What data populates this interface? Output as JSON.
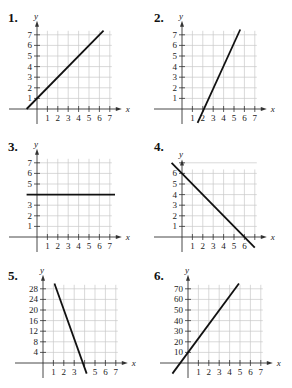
{
  "problems": [
    {
      "label": "1.",
      "xlabel": "x",
      "ylabel": "y"
    },
    {
      "label": "2.",
      "xlabel": "x",
      "ylabel": "y"
    },
    {
      "label": "3.",
      "xlabel": "x",
      "ylabel": "y"
    },
    {
      "label": "4.",
      "xlabel": "x",
      "ylabel": "y"
    },
    {
      "label": "5.",
      "xlabel": "x",
      "ylabel": "y"
    },
    {
      "label": "6.",
      "xlabel": "x",
      "ylabel": "y"
    }
  ],
  "chart_data": [
    {
      "type": "line",
      "title": "1.",
      "xlabel": "x",
      "ylabel": "y",
      "x_ticks": [
        1,
        2,
        3,
        4,
        5,
        6,
        7
      ],
      "y_ticks": [
        1,
        2,
        3,
        4,
        5,
        6,
        7
      ],
      "xlim": [
        -1,
        7.5
      ],
      "ylim": [
        -1,
        7.8
      ],
      "grid": true,
      "series": [
        {
          "name": "line",
          "x": [
            -1,
            6.4
          ],
          "y": [
            0,
            7.4
          ]
        }
      ],
      "equation_hint": "y = x + 1"
    },
    {
      "type": "line",
      "title": "2.",
      "xlabel": "x",
      "ylabel": "y",
      "x_ticks": [
        1,
        2,
        3,
        4,
        5,
        6,
        7
      ],
      "y_ticks": [
        1,
        2,
        3,
        4,
        5,
        6,
        7
      ],
      "xlim": [
        -0.5,
        7.5
      ],
      "ylim": [
        -1,
        7.8
      ],
      "grid": true,
      "series": [
        {
          "name": "line",
          "x": [
            1.5,
            5.6
          ],
          "y": [
            -1.3,
            7.5
          ]
        }
      ],
      "equation_hint": "y = 2x - 4"
    },
    {
      "type": "line",
      "title": "3.",
      "xlabel": "x",
      "ylabel": "y",
      "x_ticks": [
        1,
        2,
        3,
        4,
        5,
        6,
        7
      ],
      "y_ticks": [
        1,
        2,
        3,
        5,
        6,
        7
      ],
      "xlim": [
        -1,
        7.5
      ],
      "ylim": [
        -1,
        7.8
      ],
      "grid": true,
      "series": [
        {
          "name": "line",
          "x": [
            -1,
            7.5
          ],
          "y": [
            4,
            4
          ]
        }
      ],
      "equation_hint": "y = 4"
    },
    {
      "type": "line",
      "title": "4.",
      "xlabel": "x",
      "ylabel": "y",
      "x_ticks": [
        1,
        2,
        3,
        4,
        5,
        6
      ],
      "y_ticks": [
        1,
        2,
        3,
        4,
        5,
        6
      ],
      "xlim": [
        -1,
        7.5
      ],
      "ylim": [
        -1,
        7.8
      ],
      "grid": true,
      "series": [
        {
          "name": "line",
          "x": [
            -1,
            7
          ],
          "y": [
            7,
            -1
          ]
        }
      ],
      "equation_hint": "y = -x + 6"
    },
    {
      "type": "line",
      "title": "5.",
      "xlabel": "x",
      "ylabel": "y",
      "x_ticks": [
        1,
        2,
        3,
        5,
        6,
        7
      ],
      "y_ticks": [
        4,
        8,
        12,
        16,
        20,
        24,
        28
      ],
      "xlim": [
        -1,
        7.5
      ],
      "ylim": [
        -4,
        31
      ],
      "grid": true,
      "series": [
        {
          "name": "line",
          "x": [
            1.1,
            4.2
          ],
          "y": [
            30,
            -4
          ]
        }
      ],
      "equation_hint": "y = -10x + 40 (approx)"
    },
    {
      "type": "line",
      "title": "6.",
      "xlabel": "x",
      "ylabel": "y",
      "x_ticks": [
        1,
        2,
        3,
        4,
        5,
        6,
        7
      ],
      "y_ticks": [
        10,
        20,
        30,
        40,
        50,
        60,
        70
      ],
      "xlim": [
        -1,
        7.5
      ],
      "ylim": [
        -10,
        78
      ],
      "grid": true,
      "series": [
        {
          "name": "line",
          "x": [
            -1.5,
            4.9
          ],
          "y": [
            -10,
            75
          ]
        }
      ],
      "equation_hint": "y = 13x + 10 (approx)"
    }
  ]
}
